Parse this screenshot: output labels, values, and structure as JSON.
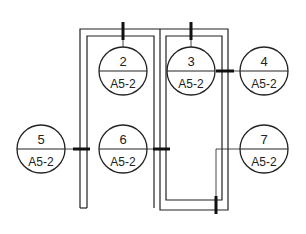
{
  "diagram": {
    "type": "section-callout-plan",
    "callouts": [
      {
        "id": "2",
        "number": "2",
        "sheet": "A5-2"
      },
      {
        "id": "3",
        "number": "3",
        "sheet": "A5-2"
      },
      {
        "id": "4",
        "number": "4",
        "sheet": "A5-2"
      },
      {
        "id": "5",
        "number": "5",
        "sheet": "A5-2"
      },
      {
        "id": "6",
        "number": "6",
        "sheet": "A5-2"
      },
      {
        "id": "7",
        "number": "7",
        "sheet": "A5-2"
      }
    ],
    "colors": {
      "line": "#222222",
      "background": "#ffffff"
    }
  }
}
